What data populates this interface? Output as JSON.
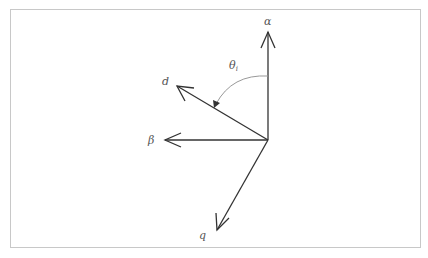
{
  "diagram": {
    "title": "",
    "origin": {
      "x": 268,
      "y": 140
    },
    "axes": [
      {
        "name": "alpha",
        "label": "α",
        "tip": {
          "x": 268,
          "y": 32
        },
        "label_pos": {
          "x": 264,
          "y": 25
        }
      },
      {
        "name": "beta",
        "label": "β",
        "tip": {
          "x": 165,
          "y": 140
        },
        "label_pos": {
          "x": 148,
          "y": 144
        }
      },
      {
        "name": "d",
        "label": "d",
        "tip": {
          "x": 177,
          "y": 86
        },
        "label_pos": {
          "x": 162,
          "y": 85
        }
      },
      {
        "name": "q",
        "label": "q",
        "tip": {
          "x": 217,
          "y": 230
        },
        "label_pos": {
          "x": 199,
          "y": 239
        }
      }
    ],
    "angle": {
      "label": "θ",
      "subscript": "i",
      "label_pos": {
        "x": 229,
        "y": 69
      },
      "from_axis": "alpha",
      "to_axis": "d"
    },
    "colors": {
      "line": "#333333",
      "arc": "#999999",
      "frame": "#c8c8c8",
      "text": "#555555"
    }
  }
}
